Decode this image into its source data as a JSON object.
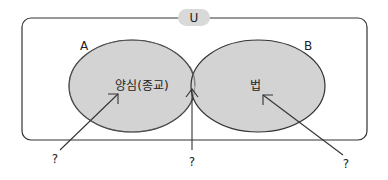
{
  "diagram": {
    "type": "venn",
    "universe_label": "U",
    "set_a": {
      "label": "A",
      "content": "양심(종교)"
    },
    "set_b": {
      "label": "B",
      "content": "법"
    },
    "questions": [
      {
        "label": "?",
        "points_to": "A only"
      },
      {
        "label": "?",
        "points_to": "A ∩ B"
      },
      {
        "label": "?",
        "points_to": "B only"
      }
    ],
    "colors": {
      "fill": "#d3d3d3",
      "stroke": "#333333",
      "pill": "#d9d9d9",
      "background": "#ffffff"
    }
  }
}
